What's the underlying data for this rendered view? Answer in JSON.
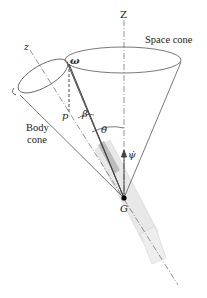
{
  "diagram": {
    "labels": {
      "Z": "Z",
      "z": "z",
      "space_cone": "Space cone",
      "body_cone_line1": "Body",
      "body_cone_line2": "cone",
      "omega": "ω",
      "p": "p",
      "beta": "β",
      "theta": "θ",
      "psi_dot": "ψ̇",
      "G": "G"
    },
    "colors": {
      "line": "#555555",
      "cylinder": "#e6e6e6",
      "cylinder_shade": "#c8c8c8"
    }
  }
}
